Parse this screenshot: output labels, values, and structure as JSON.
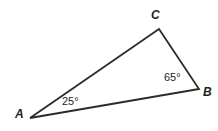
{
  "figure": {
    "type": "triangle-diagram",
    "background_color": "#ffffff",
    "stroke_color": "#2b2b2b",
    "text_color": "#231f20",
    "stroke_width": 1.8,
    "width": 218,
    "height": 131
  },
  "triangle": {
    "vertices": [
      {
        "name": "A",
        "label": "A",
        "x": 30,
        "y": 118
      },
      {
        "name": "B",
        "label": "B",
        "x": 199,
        "y": 89
      },
      {
        "name": "C",
        "label": "C",
        "x": 159,
        "y": 29
      }
    ],
    "sides": [
      {
        "name": "AC",
        "from": "A",
        "to": "C"
      },
      {
        "name": "CB",
        "from": "C",
        "to": "B"
      },
      {
        "name": "AB",
        "from": "A",
        "to": "B"
      }
    ],
    "path": "M 30,118 L 159,29 L 199,89 Z"
  },
  "angles": [
    {
      "at_vertex": "A",
      "label": "25°",
      "value": 25,
      "unit": "degrees"
    },
    {
      "at_vertex": "B",
      "label": "65°",
      "value": 65,
      "unit": "degrees"
    }
  ]
}
